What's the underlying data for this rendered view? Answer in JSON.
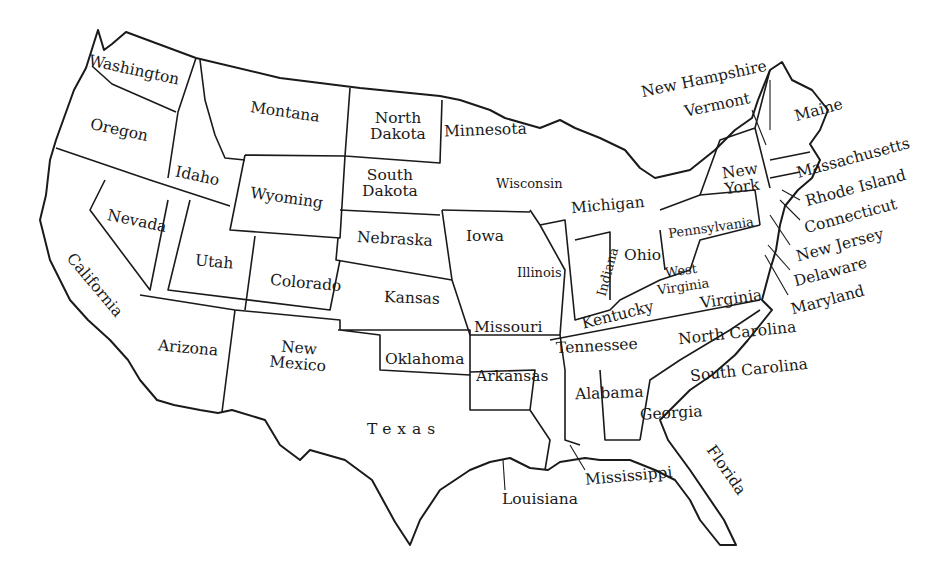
{
  "map": {
    "title": "United States",
    "colors": {
      "background": "#ffffff",
      "ink": "#1a1a1a"
    },
    "states": [
      {
        "name": "Washington",
        "x": 88,
        "y": 62,
        "rot": 12
      },
      {
        "name": "Oregon",
        "x": 90,
        "y": 122,
        "rot": 12
      },
      {
        "name": "Idaho",
        "x": 175,
        "y": 168,
        "rot": 12
      },
      {
        "name": "Montana",
        "x": 250,
        "y": 104,
        "rot": 8
      },
      {
        "name": "Wyoming",
        "x": 250,
        "y": 190,
        "rot": 8
      },
      {
        "name": "North\nDakota",
        "x": 370,
        "y": 110,
        "rot": 0
      },
      {
        "name": "South\nDakota",
        "x": 362,
        "y": 167,
        "rot": 0
      },
      {
        "name": "Nebraska",
        "x": 357,
        "y": 231,
        "rot": 3
      },
      {
        "name": "Kansas",
        "x": 384,
        "y": 290,
        "rot": 2
      },
      {
        "name": "Minnesota",
        "x": 444,
        "y": 122,
        "rot": -2
      },
      {
        "name": "Iowa",
        "x": 466,
        "y": 228,
        "rot": 0
      },
      {
        "name": "Missouri",
        "x": 474,
        "y": 319,
        "rot": 0
      },
      {
        "name": "Wisconsin",
        "x": 496,
        "y": 176,
        "rot": 0,
        "small": true
      },
      {
        "name": "Michigan",
        "x": 571,
        "y": 197,
        "rot": -5
      },
      {
        "name": "Illinois",
        "x": 517,
        "y": 265,
        "rot": 0,
        "small": true
      },
      {
        "name": "Indiana",
        "x": 583,
        "y": 264,
        "rot": -75,
        "small": true
      },
      {
        "name": "Ohio",
        "x": 624,
        "y": 247,
        "rot": 0
      },
      {
        "name": "Pennsylvania",
        "x": 668,
        "y": 220,
        "rot": -8,
        "small": true
      },
      {
        "name": "West\nVirginia",
        "x": 656,
        "y": 263,
        "rot": -8,
        "small": true
      },
      {
        "name": "Virginia",
        "x": 700,
        "y": 291,
        "rot": -8
      },
      {
        "name": "Kentucky",
        "x": 581,
        "y": 307,
        "rot": -14
      },
      {
        "name": "Tennessee",
        "x": 556,
        "y": 338,
        "rot": -3
      },
      {
        "name": "North Carolina",
        "x": 678,
        "y": 325,
        "rot": -6
      },
      {
        "name": "South Carolina",
        "x": 690,
        "y": 362,
        "rot": -6
      },
      {
        "name": "Georgia",
        "x": 640,
        "y": 405,
        "rot": -3
      },
      {
        "name": "Alabama",
        "x": 575,
        "y": 385,
        "rot": -2
      },
      {
        "name": "Mississippi",
        "x": 585,
        "y": 468,
        "rot": -5
      },
      {
        "name": "Florida",
        "x": 698,
        "y": 462,
        "rot": 55
      },
      {
        "name": "Louisiana",
        "x": 502,
        "y": 491,
        "rot": 0
      },
      {
        "name": "Arkansas",
        "x": 476,
        "y": 368,
        "rot": 0
      },
      {
        "name": "Oklahoma",
        "x": 385,
        "y": 351,
        "rot": 0
      },
      {
        "name": "Texas",
        "x": 367,
        "y": 421,
        "rot": 0,
        "spaced": true
      },
      {
        "name": "New\nMexico",
        "x": 270,
        "y": 340,
        "rot": 5
      },
      {
        "name": "Arizona",
        "x": 158,
        "y": 340,
        "rot": 5
      },
      {
        "name": "Colorado",
        "x": 270,
        "y": 275,
        "rot": 5
      },
      {
        "name": "Utah",
        "x": 195,
        "y": 254,
        "rot": 5
      },
      {
        "name": "Nevada",
        "x": 107,
        "y": 213,
        "rot": 12
      },
      {
        "name": "California",
        "x": 56,
        "y": 277,
        "rot": 50
      },
      {
        "name": "New\nYork",
        "x": 723,
        "y": 163,
        "rot": -8
      },
      {
        "name": "New Hampshire",
        "x": 640,
        "y": 71,
        "rot": -12
      },
      {
        "name": "Vermont",
        "x": 684,
        "y": 97,
        "rot": -12
      },
      {
        "name": "Maine",
        "x": 794,
        "y": 102,
        "rot": -15
      },
      {
        "name": "Massachusetts",
        "x": 795,
        "y": 150,
        "rot": -15
      },
      {
        "name": "Rhode Island",
        "x": 804,
        "y": 180,
        "rot": -15
      },
      {
        "name": "Connecticut",
        "x": 803,
        "y": 208,
        "rot": -15
      },
      {
        "name": "New Jersey",
        "x": 795,
        "y": 237,
        "rot": -15
      },
      {
        "name": "Delaware",
        "x": 793,
        "y": 264,
        "rot": -15
      },
      {
        "name": "Maryland",
        "x": 790,
        "y": 292,
        "rot": -15
      }
    ]
  }
}
